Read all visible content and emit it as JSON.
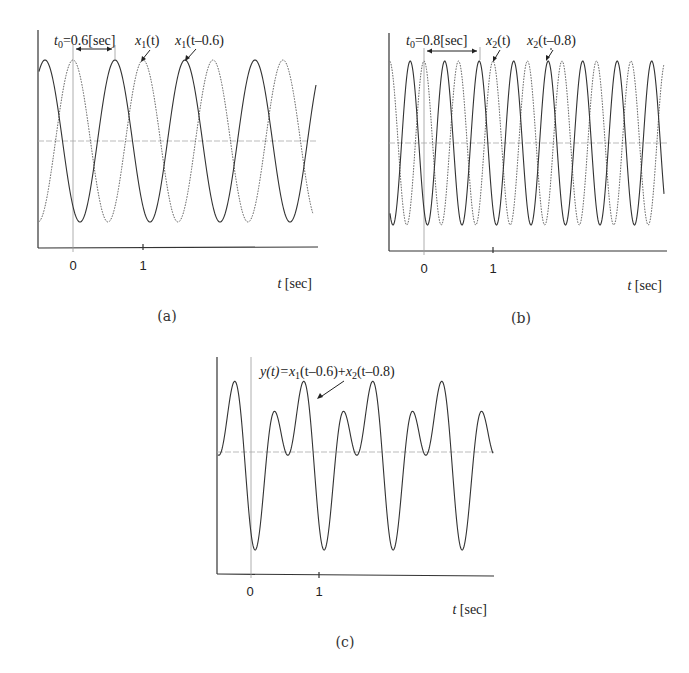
{
  "chart_data": [
    {
      "id": "a",
      "type": "line",
      "caption": "(a)",
      "xlabel": "t [sec]",
      "ylabel": "",
      "xticks": [
        "0",
        "1"
      ],
      "xlim": [
        -0.5,
        3.5
      ],
      "ylim": [
        -1.2,
        1.3
      ],
      "grid": false,
      "annotations": {
        "shift": "t₀=0.6[sec]",
        "original": "x₁(t)",
        "shifted": "x₁(t–0.6)"
      },
      "series": [
        {
          "name": "x1(t)",
          "style": "dashed",
          "formula": "cos(2*pi*1*t)",
          "frequency_hz": 1,
          "shift_sec": 0
        },
        {
          "name": "x1(t-0.6)",
          "style": "solid",
          "formula": "cos(2*pi*1*(t-0.6))",
          "frequency_hz": 1,
          "shift_sec": 0.6
        }
      ]
    },
    {
      "id": "b",
      "type": "line",
      "caption": "(b)",
      "xlabel": "t [sec]",
      "ylabel": "",
      "xticks": [
        "0",
        "1"
      ],
      "xlim": [
        -0.5,
        3.5
      ],
      "ylim": [
        -1.2,
        1.3
      ],
      "grid": false,
      "annotations": {
        "shift": "t₀=0.8[sec]",
        "original": "x₂(t)",
        "shifted": "x₂(t–0.8)"
      },
      "series": [
        {
          "name": "x2(t)",
          "style": "dashed",
          "formula": "cos(2*pi*2*t)",
          "frequency_hz": 2,
          "shift_sec": 0
        },
        {
          "name": "x2(t-0.8)",
          "style": "solid",
          "formula": "cos(2*pi*2*(t-0.8))",
          "frequency_hz": 2,
          "shift_sec": 0.8
        }
      ]
    },
    {
      "id": "c",
      "type": "line",
      "caption": "(c)",
      "xlabel": "t [sec]",
      "ylabel": "",
      "xticks": [
        "0",
        "1"
      ],
      "xlim": [
        -0.5,
        3.5
      ],
      "ylim": [
        -2.2,
        1.9
      ],
      "grid": false,
      "annotations": {
        "sum": "y(t)=x₁(t–0.6)+x₂(t–0.8)"
      },
      "series": [
        {
          "name": "y(t)",
          "style": "solid",
          "formula": "cos(2*pi*(t-0.6)) + cos(4*pi*(t-0.8))"
        }
      ]
    }
  ],
  "panels": {
    "a": {
      "caption": "(a)",
      "tick0": "0",
      "tick1": "1",
      "xlabel_t": "t",
      "xlabel_unit": "[sec]",
      "t0_sym": "t",
      "t0_sub": "0",
      "t0_val": "=0.6[sec]",
      "orig_x": "x",
      "orig_sub": "1",
      "orig_arg": "(t)",
      "shift_x": "x",
      "shift_sub": "1",
      "shift_arg": "(t–0.6)"
    },
    "b": {
      "caption": "(b)",
      "tick0": "0",
      "tick1": "1",
      "xlabel_t": "t",
      "xlabel_unit": "[sec]",
      "t0_sym": "t",
      "t0_sub": "0",
      "t0_val": "=0.8[sec]",
      "orig_x": "x",
      "orig_sub": "2",
      "orig_arg": "(t)",
      "shift_x": "x",
      "shift_sub": "2",
      "shift_arg": "(t–0.8)"
    },
    "c": {
      "caption": "(c)",
      "tick0": "0",
      "tick1": "1",
      "xlabel_t": "t",
      "xlabel_unit": "[sec]",
      "y_lhs": "y(t)=",
      "x1": "x",
      "x1_sub": "1",
      "x1_arg": "(t–0.6)+",
      "x2": "x",
      "x2_sub": "2",
      "x2_arg": "(t–0.8)"
    }
  }
}
